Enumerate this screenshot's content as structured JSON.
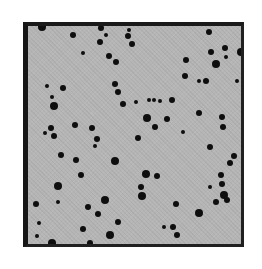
{
  "image": {
    "description": "Grayscale micrograph of a square field with scattered dark particles",
    "frame": {
      "x": 23,
      "y": 22,
      "width": 221,
      "height": 225,
      "border_color": "#1a1a1a",
      "fill_color": "#b5b5b5"
    },
    "particle_color": "#0e0e0e",
    "particles": [
      [
        42,
        27,
        4
      ],
      [
        73,
        35,
        3
      ],
      [
        83,
        53,
        2
      ],
      [
        63,
        88,
        3
      ],
      [
        47,
        86,
        2
      ],
      [
        101,
        28,
        3
      ],
      [
        106,
        35,
        2
      ],
      [
        100,
        42,
        3
      ],
      [
        128,
        36,
        3
      ],
      [
        132,
        44,
        3
      ],
      [
        129,
        30,
        2
      ],
      [
        109,
        56,
        3
      ],
      [
        116,
        62,
        3
      ],
      [
        115,
        84,
        3
      ],
      [
        118,
        92,
        3
      ],
      [
        209,
        32,
        3
      ],
      [
        211,
        52,
        3
      ],
      [
        225,
        48,
        3
      ],
      [
        186,
        60,
        3
      ],
      [
        216,
        64,
        4
      ],
      [
        185,
        76,
        3
      ],
      [
        206,
        81,
        3
      ],
      [
        226,
        57,
        2
      ],
      [
        241,
        52,
        4
      ],
      [
        199,
        81,
        2
      ],
      [
        237,
        81,
        2
      ],
      [
        52,
        97,
        2
      ],
      [
        54,
        106,
        4
      ],
      [
        51,
        128,
        3
      ],
      [
        45,
        133,
        2
      ],
      [
        54,
        136,
        3
      ],
      [
        61,
        155,
        3
      ],
      [
        75,
        125,
        3
      ],
      [
        76,
        160,
        3
      ],
      [
        92,
        128,
        3
      ],
      [
        123,
        104,
        3
      ],
      [
        147,
        118,
        4
      ],
      [
        136,
        102,
        2
      ],
      [
        149,
        100,
        2
      ],
      [
        154,
        100,
        2
      ],
      [
        160,
        101,
        2
      ],
      [
        167,
        119,
        3
      ],
      [
        155,
        127,
        3
      ],
      [
        138,
        138,
        3
      ],
      [
        97,
        139,
        3
      ],
      [
        95,
        146,
        2
      ],
      [
        115,
        161,
        4
      ],
      [
        172,
        100,
        3
      ],
      [
        199,
        113,
        3
      ],
      [
        222,
        117,
        3
      ],
      [
        223,
        127,
        3
      ],
      [
        183,
        132,
        2
      ],
      [
        210,
        147,
        3
      ],
      [
        234,
        156,
        3
      ],
      [
        230,
        163,
        3
      ],
      [
        58,
        186,
        4
      ],
      [
        36,
        204,
        3
      ],
      [
        58,
        202,
        2
      ],
      [
        39,
        223,
        2
      ],
      [
        37,
        236,
        2
      ],
      [
        52,
        243,
        4
      ],
      [
        88,
        207,
        3
      ],
      [
        83,
        229,
        3
      ],
      [
        90,
        243,
        3
      ],
      [
        81,
        175,
        3
      ],
      [
        146,
        174,
        4
      ],
      [
        157,
        176,
        3
      ],
      [
        141,
        187,
        3
      ],
      [
        142,
        196,
        4
      ],
      [
        105,
        200,
        4
      ],
      [
        98,
        214,
        3
      ],
      [
        118,
        222,
        3
      ],
      [
        110,
        235,
        4
      ],
      [
        164,
        227,
        2
      ],
      [
        221,
        175,
        3
      ],
      [
        222,
        184,
        3
      ],
      [
        224,
        195,
        4
      ],
      [
        227,
        200,
        3
      ],
      [
        216,
        202,
        3
      ],
      [
        210,
        187,
        2
      ],
      [
        176,
        204,
        3
      ],
      [
        199,
        213,
        4
      ],
      [
        173,
        227,
        3
      ],
      [
        177,
        235,
        3
      ]
    ]
  }
}
